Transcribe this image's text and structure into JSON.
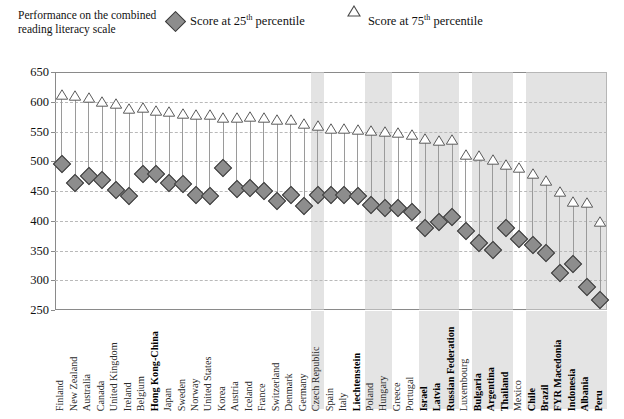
{
  "header": {
    "axis_title": "Performance on the combined reading literacy scale",
    "legend": [
      {
        "name": "legend-25th",
        "marker": "diamond",
        "label_pre": "Score at 25",
        "label_sup": "th",
        "label_post": " percentile"
      },
      {
        "name": "legend-75th",
        "marker": "triangle",
        "label_pre": "Score at 75",
        "label_sup": "th",
        "label_post": " percentile"
      }
    ]
  },
  "chart_data": {
    "type": "scatter",
    "title": "Performance on the combined reading literacy scale",
    "xlabel": "",
    "ylabel": "Performance on the combined reading literacy scale",
    "ylim": [
      250,
      650
    ],
    "yticks": [
      250,
      300,
      350,
      400,
      450,
      500,
      550,
      600,
      650
    ],
    "grid": true,
    "legend_position": "top",
    "categories": [
      "Finland",
      "New Zealand",
      "Australia",
      "Canada",
      "United Kingdom",
      "Ireland",
      "Belgium",
      "Hong Kong-China",
      "Japan",
      "Sweden",
      "Norway",
      "United States",
      "Korea",
      "Austria",
      "Iceland",
      "France",
      "Switzerland",
      "Denmark",
      "Germany",
      "Czech Republic",
      "Spain",
      "Italy",
      "Liechtenstein",
      "Poland",
      "Hungary",
      "Greece",
      "Portugal",
      "Israel",
      "Latvia",
      "Russian Federation",
      "Luxembourg",
      "Bulgaria",
      "Argentina",
      "Thailand",
      "Mexico",
      "Chile",
      "Brazil",
      "FYR Macedonia",
      "Indonesia",
      "Albania",
      "Peru"
    ],
    "bold_categories": [
      "Hong Kong-China",
      "Liechtenstein",
      "Israel",
      "Latvia",
      "Russian Federation",
      "Bulgaria",
      "Argentina",
      "Thailand",
      "Chile",
      "Brazil",
      "FYR Macedonia",
      "Indonesia",
      "Albania",
      "Peru"
    ],
    "shaded_categories": [
      "Czech Republic",
      "Poland",
      "Hungary",
      "Israel",
      "Latvia",
      "Russian Federation",
      "Bulgaria",
      "Argentina",
      "Thailand",
      "Chile",
      "Brazil",
      "FYR Macedonia",
      "Indonesia",
      "Albania",
      "Peru"
    ],
    "series": [
      {
        "name": "Score at 25th percentile",
        "marker": "diamond",
        "values": [
          496,
          463,
          476,
          468,
          452,
          441,
          478,
          479,
          463,
          462,
          443,
          442,
          488,
          454,
          455,
          450,
          434,
          443,
          424,
          443,
          443,
          444,
          442,
          427,
          421,
          421,
          414,
          388,
          398,
          406,
          383,
          362,
          351,
          388,
          370,
          359,
          345,
          313,
          328,
          288,
          266
        ]
      },
      {
        "name": "Score at 75th percentile",
        "marker": "triangle",
        "values": [
          611,
          609,
          607,
          600,
          597,
          588,
          589,
          584,
          583,
          580,
          578,
          577,
          572,
          573,
          574,
          572,
          570,
          570,
          562,
          560,
          555,
          554,
          553,
          551,
          549,
          547,
          544,
          538,
          534,
          535,
          511,
          509,
          502,
          493,
          488,
          479,
          466,
          448,
          431,
          429,
          398
        ]
      }
    ]
  },
  "footnote": "",
  "colors": {
    "marker_fill": "#8d8d8d",
    "marker_edge": "#3c3c3c",
    "stem": "#9a9a9a",
    "grid": "#b9b9b9",
    "frame": "#8a8a8a",
    "band": "#d2d2d2"
  }
}
